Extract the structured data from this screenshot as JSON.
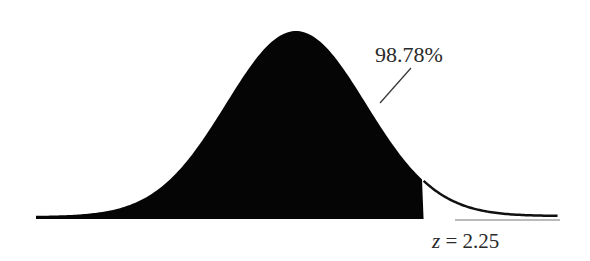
{
  "diagram": {
    "type": "normal-distribution-shaded-area",
    "shaded_region": "left of z",
    "area_label": "98.78%",
    "z_label_var": "z",
    "z_label_eq": " = 2.25",
    "z_value": 2.25,
    "area_percent": 98.78,
    "colors": {
      "fill": "#050505",
      "curve": "#111111",
      "background": "#ffffff"
    }
  }
}
